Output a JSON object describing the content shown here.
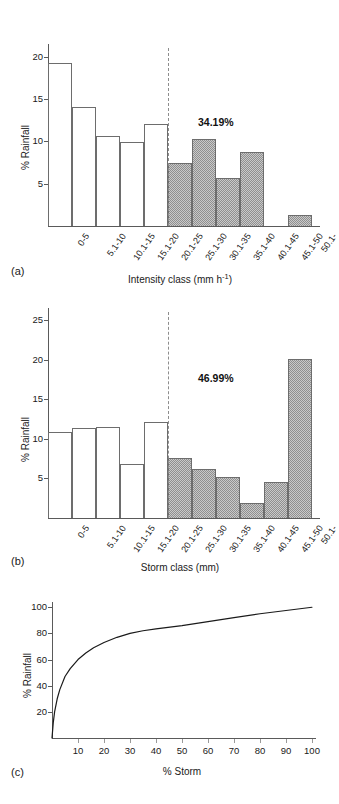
{
  "figure": {
    "panels": [
      {
        "tag": "(a)"
      },
      {
        "tag": "(b)"
      },
      {
        "tag": "(c)"
      }
    ]
  },
  "chart_data": [
    {
      "type": "bar",
      "panel": "(a)",
      "title": "",
      "xlabel": "Intensity class (mm h⁻¹)",
      "ylabel": "% Rainfall",
      "categories": [
        "0-5",
        "5.1-10",
        "10.1-15",
        "15.1-20",
        "20.1-25",
        "25.1-30",
        "30.1-35",
        "35.1-40",
        "40.1-45",
        "45.1-50",
        "50.1-"
      ],
      "values": [
        19.2,
        14.0,
        10.6,
        9.9,
        12.1,
        7.4,
        10.3,
        5.7,
        8.8,
        0.0,
        1.3
      ],
      "shaded_from_index": 5,
      "shaded_categories": [
        "25.1-30",
        "30.1-35",
        "35.1-40",
        "40.1-45",
        "45.1-50",
        "50.1-"
      ],
      "annotation": "34.19%",
      "divider_after_category": "20.1-25",
      "yticks": [
        5,
        10,
        15,
        20
      ],
      "ylim": [
        0,
        21.5
      ],
      "grid": false,
      "legend": "none"
    },
    {
      "type": "bar",
      "panel": "(b)",
      "title": "",
      "xlabel": "Storm class (mm)",
      "ylabel": "% Rainfall",
      "categories": [
        "0-5",
        "5.1-10",
        "10.1-15",
        "15.1-20",
        "20.1-25",
        "25.1-30",
        "30.1-35",
        "35.1-40",
        "40.1-45",
        "45.1-50",
        "50.1-"
      ],
      "values": [
        10.8,
        11.3,
        11.5,
        6.8,
        12.1,
        7.6,
        6.2,
        5.2,
        1.9,
        4.5,
        20.1
      ],
      "shaded_from_index": 5,
      "shaded_categories": [
        "25.1-30",
        "30.1-35",
        "35.1-40",
        "40.1-45",
        "45.1-50",
        "50.1-"
      ],
      "annotation": "46.99%",
      "divider_after_category": "20.1-25",
      "yticks": [
        5,
        10,
        15,
        20,
        25
      ],
      "ylim": [
        0,
        26.5
      ],
      "grid": false,
      "legend": "none"
    },
    {
      "type": "line",
      "panel": "(c)",
      "title": "",
      "xlabel": "% Storm",
      "ylabel": "% Rainfall",
      "xticks": [
        10,
        20,
        30,
        40,
        50,
        60,
        70,
        80,
        90,
        100
      ],
      "yticks": [
        20,
        40,
        60,
        80,
        100
      ],
      "xlim": [
        0,
        100
      ],
      "ylim": [
        0,
        104
      ],
      "grid": false,
      "legend": "none",
      "x": [
        0,
        0.5,
        1,
        2,
        3,
        5,
        7,
        10,
        13,
        16,
        20,
        25,
        30,
        35,
        40,
        50,
        60,
        70,
        80,
        90,
        100
      ],
      "y": [
        0,
        12,
        20,
        30,
        37,
        47,
        53,
        60,
        65,
        69,
        73,
        77,
        80,
        82,
        83.5,
        86,
        89,
        92,
        95,
        97.5,
        100
      ]
    }
  ]
}
